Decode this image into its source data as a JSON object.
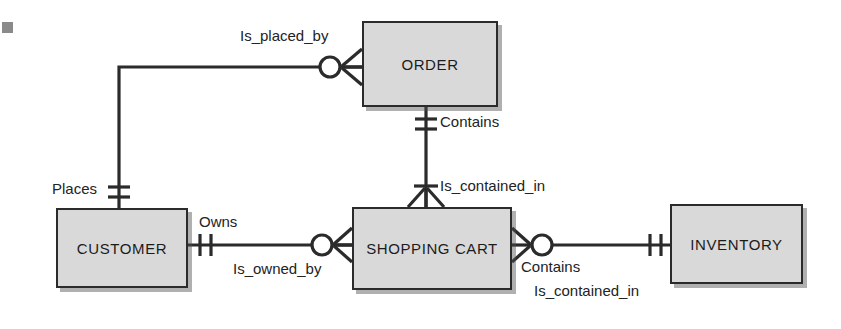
{
  "diagram": {
    "notation": "crow's foot",
    "line_color": "#2b2b2b",
    "entity_fill": "#d9d9d9",
    "entity_border": "#2b2b2b",
    "background": "#ffffff"
  },
  "entities": [
    {
      "id": "order",
      "name": "ORDER",
      "x": 362,
      "y": 21,
      "w": 136,
      "h": 86
    },
    {
      "id": "customer",
      "name": "CUSTOMER",
      "x": 56,
      "y": 208,
      "w": 132,
      "h": 80
    },
    {
      "id": "cart",
      "name": "SHOPPING CART",
      "x": 352,
      "y": 207,
      "w": 160,
      "h": 83
    },
    {
      "id": "inventory",
      "name": "INVENTORY",
      "x": 670,
      "y": 204,
      "w": 133,
      "h": 80
    }
  ],
  "relationships": [
    {
      "id": "customer-order",
      "from": "customer",
      "to": "order",
      "label_forward": "Places",
      "label_reverse": "Is_placed_by",
      "from_cardinality": "one-and-only-one",
      "to_cardinality": "zero-or-many"
    },
    {
      "id": "order-cart",
      "from": "order",
      "to": "cart",
      "label_forward": "Contains",
      "label_reverse": "Is_contained_in",
      "from_cardinality": "one-and-only-one",
      "to_cardinality": "one-or-many"
    },
    {
      "id": "customer-cart",
      "from": "customer",
      "to": "cart",
      "label_forward": "Owns",
      "label_reverse": "Is_owned_by",
      "from_cardinality": "one-and-only-one",
      "to_cardinality": "zero-or-many"
    },
    {
      "id": "cart-inventory",
      "from": "cart",
      "to": "inventory",
      "label_forward": "Contains",
      "label_reverse": "Is_contained_in",
      "from_cardinality": "zero-or-many",
      "to_cardinality": "one-and-only-one"
    }
  ],
  "labels": {
    "is_placed_by": {
      "text": "Is_placed_by",
      "x": 240,
      "y": 28
    },
    "places": {
      "text": "Places",
      "x": 52,
      "y": 181
    },
    "contains_order_cart": {
      "text": "Contains",
      "x": 440,
      "y": 114
    },
    "is_contained_in_cart": {
      "text": "Is_contained_in",
      "x": 440,
      "y": 178
    },
    "owns": {
      "text": "Owns",
      "x": 199,
      "y": 214
    },
    "is_owned_by": {
      "text": "Is_owned_by",
      "x": 233,
      "y": 261
    },
    "contains_cart_inv": {
      "text": "Contains",
      "x": 521,
      "y": 259
    },
    "is_contained_in_inv": {
      "text": "Is_contained_in",
      "x": 534,
      "y": 283
    }
  },
  "artifact": {
    "id": "page-edge-mark",
    "x": 2,
    "y": 22,
    "w": 11,
    "h": 11,
    "color": "#8a8a8a"
  }
}
